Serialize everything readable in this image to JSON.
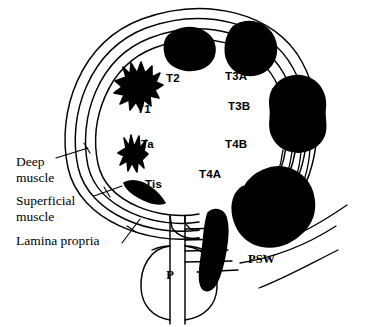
{
  "figure": {
    "background_color": "#ffffff",
    "ink_color": "#000000"
  },
  "anatomy_labels": [
    {
      "id": "deep-muscle",
      "line1": "Deep",
      "line2": "muscle"
    },
    {
      "id": "superficial-muscle",
      "line1": "Superficial",
      "line2": "muscle"
    },
    {
      "id": "lamina-propria",
      "line1": "Lamina propria",
      "line2": ""
    }
  ],
  "organ_labels": [
    {
      "id": "prostate",
      "text": "P"
    },
    {
      "id": "perivesical-soft-wall",
      "text": "PSW"
    }
  ],
  "stage_labels": [
    {
      "id": "t1",
      "text": "T1"
    },
    {
      "id": "t2",
      "text": "T2"
    },
    {
      "id": "ta",
      "text": "Ta"
    },
    {
      "id": "tis",
      "text": "Tis"
    },
    {
      "id": "t3a",
      "text": "T3A"
    },
    {
      "id": "t3b",
      "text": "T3B"
    },
    {
      "id": "t4a",
      "text": "T4A"
    },
    {
      "id": "t4b",
      "text": "T4B"
    }
  ],
  "wall_layers": {
    "count": 4,
    "names": [
      "outer-serosa",
      "deep-muscle",
      "superficial-muscle",
      "lamina-propria"
    ]
  }
}
